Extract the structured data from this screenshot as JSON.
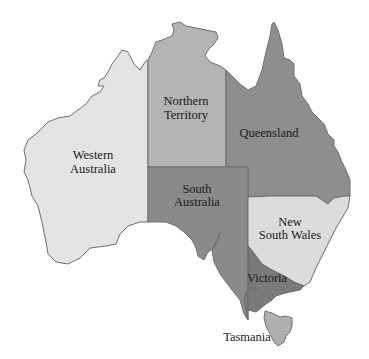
{
  "map": {
    "title": "Australia states and territories",
    "states": [
      {
        "id": "western-australia",
        "label_lines": [
          "Western",
          "Australia"
        ],
        "color": "#e4e4e4"
      },
      {
        "id": "northern-territory",
        "label_lines": [
          "Northern",
          "Territory"
        ],
        "color": "#b4b4b4"
      },
      {
        "id": "queensland",
        "label_lines": [
          "Queensland"
        ],
        "color": "#8e8e8e"
      },
      {
        "id": "south-australia",
        "label_lines": [
          "South",
          "Australia"
        ],
        "color": "#8a8a8a"
      },
      {
        "id": "new-south-wales",
        "label_lines": [
          "New",
          "South Wales"
        ],
        "color": "#dcdcdc"
      },
      {
        "id": "victoria",
        "label_lines": [
          "Victoria"
        ],
        "color": "#7a7a7a"
      },
      {
        "id": "tasmania",
        "label_lines": [
          "Tasmania"
        ],
        "color": "#b0b0b0"
      }
    ],
    "border_color": "#6e6e6e",
    "background": "#ffffff"
  }
}
